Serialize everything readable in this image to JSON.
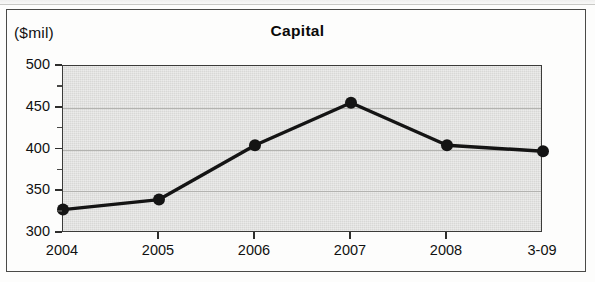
{
  "chart_data": {
    "type": "line",
    "title": "Capital",
    "unit_label": "($mil)",
    "xlabel": "",
    "ylabel": "",
    "categories": [
      "2004",
      "2005",
      "2006",
      "2007",
      "2008",
      "3-09"
    ],
    "values": [
      328,
      340,
      405,
      456,
      405,
      398
    ],
    "series": [
      {
        "name": "Capital",
        "values": [
          328,
          340,
          405,
          456,
          405,
          398
        ]
      }
    ],
    "ylim": [
      300,
      500
    ],
    "ytick_labels": [
      "500",
      "450",
      "400",
      "350",
      "300"
    ],
    "ytick_values": [
      500,
      450,
      400,
      350,
      300
    ],
    "yminor_tick_values": [
      475,
      425,
      375,
      325
    ],
    "ytick_step": 50,
    "grid": true,
    "grid_axis": "y",
    "legend": false,
    "marker": "circle",
    "line_color": "#141414",
    "marker_color": "#141414",
    "plot_background": "#d8d8d6",
    "frame_color": "#4a4a48"
  }
}
